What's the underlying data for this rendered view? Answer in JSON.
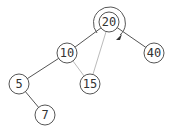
{
  "diagram": {
    "type": "binary-tree-rotation",
    "nodes": [
      {
        "id": "n20",
        "label": "20",
        "x": 109,
        "y": 22
      },
      {
        "id": "n10",
        "label": "10",
        "x": 67,
        "y": 53
      },
      {
        "id": "n40",
        "label": "40",
        "x": 154,
        "y": 53
      },
      {
        "id": "n5",
        "label": "5",
        "x": 19,
        "y": 84
      },
      {
        "id": "n15",
        "label": "15",
        "x": 90,
        "y": 84
      },
      {
        "id": "n7",
        "label": "7",
        "x": 45,
        "y": 115
      }
    ],
    "edges": [
      {
        "from": "20",
        "to": "10",
        "style": "dark"
      },
      {
        "from": "20",
        "to": "40",
        "style": "dark"
      },
      {
        "from": "10",
        "to": "5",
        "style": "dark"
      },
      {
        "from": "5",
        "to": "7",
        "style": "dark"
      },
      {
        "from": "10",
        "to": "15",
        "style": "light"
      },
      {
        "from": "20",
        "to": "15",
        "style": "light"
      }
    ],
    "rotation": {
      "around": "20",
      "direction": "clockwise"
    },
    "colors": {
      "stroke": "#555555",
      "light_edge": "#bbbbbb",
      "text": "#333333"
    }
  }
}
